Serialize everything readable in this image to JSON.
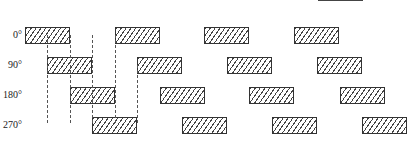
{
  "diagram": {
    "title": "",
    "rows": [
      {
        "label": "0°",
        "y": 27,
        "boxes": [
          25,
          115,
          204,
          294
        ]
      },
      {
        "label": "90°",
        "y": 57,
        "boxes": [
          47,
          137,
          227,
          317
        ]
      },
      {
        "label": "180°",
        "y": 87,
        "boxes": [
          70,
          160,
          249,
          340
        ]
      },
      {
        "label": "270°",
        "y": 117,
        "boxes": [
          92,
          182,
          272,
          362
        ]
      }
    ],
    "dashed_lines_x": [
      47,
      70,
      92,
      115,
      137
    ],
    "colors": {
      "stroke": "#333333",
      "hatch": "#444444",
      "background": "#ffffff"
    }
  }
}
